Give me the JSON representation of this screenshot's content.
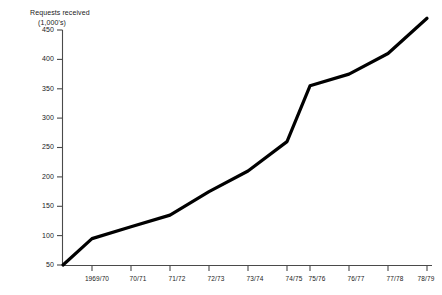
{
  "chart_data": {
    "type": "line",
    "title": "Requests received (1,000's)",
    "title_lines": [
      "Requests received",
      "(1,000's)"
    ],
    "xlabel": "",
    "ylabel": "Requests received (1,000's)",
    "categories": [
      "1969/70",
      "70/71",
      "71/72",
      "72/73",
      "73/74",
      "74/75",
      "75/76",
      "76/77",
      "77/78",
      "78/79"
    ],
    "values": [
      95,
      115,
      135,
      175,
      210,
      260,
      355,
      375,
      410,
      470
    ],
    "origin_value": 50,
    "ylim": [
      50,
      450
    ],
    "ytick_labels": [
      "450",
      "400",
      "350",
      "300",
      "250",
      "200",
      "150",
      "100",
      "50"
    ],
    "ytick_values": [
      450,
      400,
      350,
      300,
      250,
      200,
      150,
      100,
      50
    ],
    "grid": false,
    "legend": null,
    "line_color": "#000000",
    "axis_color": "#4a4a4a"
  }
}
